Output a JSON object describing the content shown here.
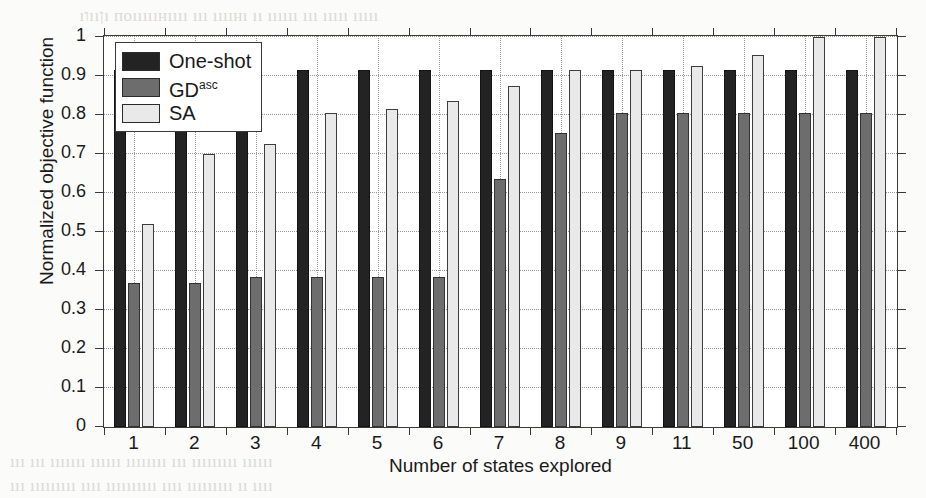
{
  "page": {
    "bleed_top": "   ıוııןı поıııııнıııı ııı ııııнı ıı ıııııı ııı ııııı ııııı",
    "bleed_bottom_1": "ııı ııı ııııııı ıııııı ıııııııı ııı ııııııııı ıııııı",
    "bleed_bottom_2": "ııı ııııııııı ıııı ıııııııııı ıııı ııııııııı ıı ıııı"
  },
  "chart_data": {
    "type": "bar",
    "title": "",
    "xlabel": "Number of states explored",
    "ylabel": "Normalized objective function",
    "categories": [
      "1",
      "2",
      "3",
      "4",
      "5",
      "6",
      "7",
      "8",
      "9",
      "11",
      "50",
      "100",
      "400"
    ],
    "ylim": [
      0,
      1
    ],
    "yticks": [
      0,
      0.1,
      0.2,
      0.3,
      0.4,
      0.5,
      0.6,
      0.7,
      0.8,
      0.9,
      1
    ],
    "ytick_labels": [
      "0",
      "0.1",
      "0.2",
      "0.3",
      "0.4",
      "0.5",
      "0.6",
      "0.7",
      "0.8",
      "0.9",
      "1"
    ],
    "grid": "horizontal-and-vertical-dotted",
    "legend_position": "top-left-inside",
    "series": [
      {
        "name": "One-shot",
        "color": "#232323",
        "values": [
          0.915,
          0.915,
          0.915,
          0.915,
          0.915,
          0.915,
          0.915,
          0.915,
          0.915,
          0.915,
          0.915,
          0.915,
          0.915
        ]
      },
      {
        "name": "GD",
        "name_sup": "asc",
        "color": "#6d6d6d",
        "values": [
          0.37,
          0.37,
          0.385,
          0.385,
          0.385,
          0.385,
          0.635,
          0.755,
          0.805,
          0.805,
          0.805,
          0.805,
          0.805
        ]
      },
      {
        "name": "SA",
        "color": "#e9e9e9",
        "values": [
          0.52,
          0.7,
          0.725,
          0.805,
          0.815,
          0.835,
          0.875,
          0.915,
          0.915,
          0.925,
          0.955,
          1.0,
          1.0
        ]
      }
    ]
  },
  "legend": {
    "items": [
      {
        "label": "One-shot",
        "sup": ""
      },
      {
        "label": "GD",
        "sup": "asc"
      },
      {
        "label": "SA",
        "sup": ""
      }
    ]
  }
}
